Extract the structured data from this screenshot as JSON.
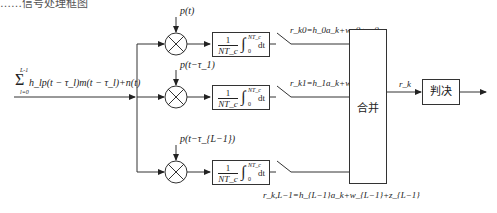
{
  "top_partial_text": "……信号处理框图",
  "input": {
    "signal_expr": "Σ_{l=0}^{L-1} h_l p(t − τ_l) m(t − τ_l) + n(t)",
    "sum_upper": "L-1",
    "sum_lower": "l=0",
    "sum_body": "h_lp(t − τ_l)m(t − τ_l)+n(t)"
  },
  "branches": [
    {
      "reference": "p(t)",
      "integrator": {
        "num": "1",
        "den": "NT_c",
        "upper": "NT_c",
        "lower": "0",
        "dt": "dt"
      },
      "output": "r_k0=h_0a_k+w_0+z_0"
    },
    {
      "reference": "p(t−τ_1)",
      "integrator": {
        "num": "1",
        "den": "NT_c",
        "upper": "NT_c",
        "lower": "0",
        "dt": "dt"
      },
      "output": "r_k1=h_1a_k+w_1+z_1"
    },
    {
      "reference": "p(t−τ_{L−1})",
      "integrator": {
        "num": "1",
        "den": "NT_c",
        "upper": "NT_c",
        "lower": "0",
        "dt": "dt"
      },
      "output": "r_k,L−1=h_{L−1}a_k+w_{L−1}+z_{L−1}"
    }
  ],
  "combiner": {
    "label": "合并"
  },
  "combined_output": "r_k",
  "decision": {
    "label": "判决"
  }
}
